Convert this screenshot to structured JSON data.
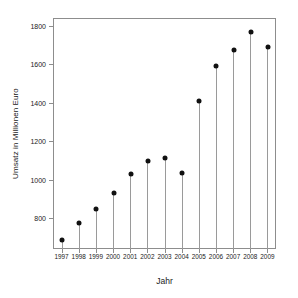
{
  "chart_data": {
    "type": "scatter",
    "title": "",
    "subtitle": "",
    "xlabel": "Jahr",
    "ylabel": "Umsatz in Millionen Euro",
    "categories": [
      "1997",
      "1998",
      "1999",
      "2000",
      "2001",
      "2002",
      "2003",
      "2004",
      "2005",
      "2006",
      "2007",
      "2008",
      "2009"
    ],
    "values": [
      690,
      780,
      855,
      935,
      1035,
      1100,
      1118,
      1040,
      1415,
      1598,
      1680,
      1775,
      1692
    ],
    "series": [
      {
        "name": "Umsatz",
        "values": [
          690,
          780,
          855,
          935,
          1035,
          1100,
          1118,
          1040,
          1415,
          1598,
          1680,
          1775,
          1692
        ]
      }
    ],
    "x_tick_labels": [
      "1997",
      "1998",
      "1999",
      "2000",
      "2001",
      "2002",
      "2003",
      "2004",
      "2005",
      "2006",
      "2007",
      "2008",
      "2009"
    ],
    "y_tick_labels": [
      "800",
      "1000",
      "1200",
      "1400",
      "1600",
      "1800"
    ],
    "y_ticks": [
      800,
      1000,
      1200,
      1400,
      1600,
      1800
    ],
    "ylim": [
      640,
      1840
    ],
    "xlim": [
      1996.4,
      2009.6
    ],
    "grid": false,
    "legend": false,
    "legend_position": "none",
    "marker": "filled-circle",
    "stems": true,
    "colors": {
      "marker": "#111111",
      "stem": "#9a9a9a",
      "frame": "#8d8d8d",
      "text": "#1a1a1a",
      "background": "#ffffff"
    }
  }
}
